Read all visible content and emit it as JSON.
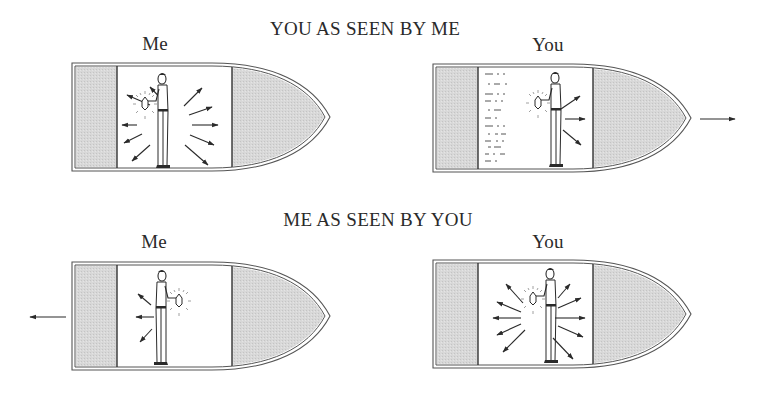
{
  "headings": {
    "top": "YOU AS SEEN BY ME",
    "bottom": "ME AS SEEN BY YOU"
  },
  "panels": [
    {
      "id": "top-me",
      "label": "Me",
      "row": "top",
      "moving": false,
      "light_rays": "symmetric",
      "motion_arrow": null
    },
    {
      "id": "top-you",
      "label": "You",
      "row": "top",
      "moving": true,
      "light_rays": "forward-shifted",
      "motion_arrow": "right",
      "wake_marks": true
    },
    {
      "id": "bottom-me",
      "label": "Me",
      "row": "bottom",
      "moving": true,
      "light_rays": "backward-shifted",
      "motion_arrow": "left"
    },
    {
      "id": "bottom-you",
      "label": "You",
      "row": "bottom",
      "moving": false,
      "light_rays": "symmetric",
      "motion_arrow": null
    }
  ],
  "icons": {
    "figure": "person-holding-lantern-icon",
    "ray": "arrow-icon",
    "motion": "motion-arrow-icon"
  },
  "colors": {
    "ink": "#2a2a2a",
    "shade": "#d6d6d6",
    "background": "#ffffff"
  }
}
